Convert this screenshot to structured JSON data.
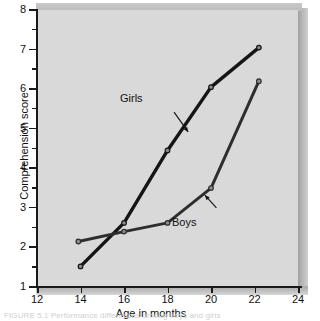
{
  "figure": {
    "caption": "FIGURE 5.1  Performance differences among boys and girls",
    "background_color": "#d9d9d9",
    "line_color": "#151515"
  },
  "chart_data": {
    "type": "line",
    "title": "",
    "xlabel": "Age in months",
    "ylabel": "Comprehension score",
    "xlim": [
      12,
      24
    ],
    "ylim": [
      1,
      8
    ],
    "xticks": [
      12,
      14,
      16,
      18,
      20,
      22,
      24
    ],
    "yticks": [
      1,
      2,
      3,
      4,
      5,
      6,
      7,
      8
    ],
    "y_minor_ticks": [
      1.5,
      2.5,
      3.5,
      4.5,
      5.5,
      6.5,
      7.5
    ],
    "grid": false,
    "legend": "inline-annotations",
    "series": [
      {
        "name": "Girls",
        "color": "#151515",
        "marker": "circle",
        "x": [
          14.0,
          16.0,
          18.0,
          20.0,
          22.2
        ],
        "y": [
          1.52,
          2.62,
          4.45,
          6.05,
          7.05
        ]
      },
      {
        "name": "Boys",
        "color": "#2e2e2e",
        "marker": "circle",
        "x": [
          13.9,
          16.0,
          18.0,
          20.0,
          22.2
        ],
        "y": [
          2.15,
          2.4,
          2.62,
          3.5,
          6.2
        ]
      }
    ],
    "annotations": [
      {
        "text": "Girls",
        "x": 18.05,
        "y": 5.62
      },
      {
        "text": "Boys",
        "x": 20.45,
        "y": 2.72
      }
    ]
  },
  "axes": {
    "x_tick_labels": [
      "12",
      "14",
      "16",
      "18",
      "20",
      "22",
      "24"
    ],
    "y_tick_labels": [
      "8",
      "7",
      "6",
      "5",
      "4",
      "3",
      "2",
      "1"
    ],
    "x_title": "Age in months",
    "y_title": "Comprehension score"
  }
}
